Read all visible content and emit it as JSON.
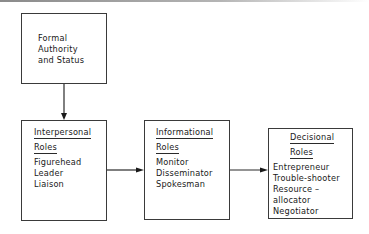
{
  "diagram": {
    "type": "flow",
    "nodes": [
      {
        "id": "authority",
        "lines": [
          "Formal",
          "Authority",
          "and Status"
        ]
      },
      {
        "id": "interpersonal",
        "heading": [
          "Interpersonal",
          "Roles"
        ],
        "items": [
          "Figurehead",
          "Leader",
          "Liaison"
        ]
      },
      {
        "id": "informational",
        "heading": [
          "Informational",
          "Roles"
        ],
        "items": [
          "Monitor",
          "Disseminator",
          "Spokesman"
        ]
      },
      {
        "id": "decisional",
        "heading": [
          "Decisional",
          "Roles"
        ],
        "items": [
          "Entrepreneur",
          "Trouble-shooter",
          "Resource –",
          "allocator",
          "Negotiator"
        ]
      }
    ],
    "edges": [
      {
        "from": "authority",
        "to": "interpersonal"
      },
      {
        "from": "interpersonal",
        "to": "informational"
      },
      {
        "from": "informational",
        "to": "decisional"
      }
    ],
    "colors": {
      "line": "#2a2a2a",
      "background": "#ffffff"
    }
  }
}
